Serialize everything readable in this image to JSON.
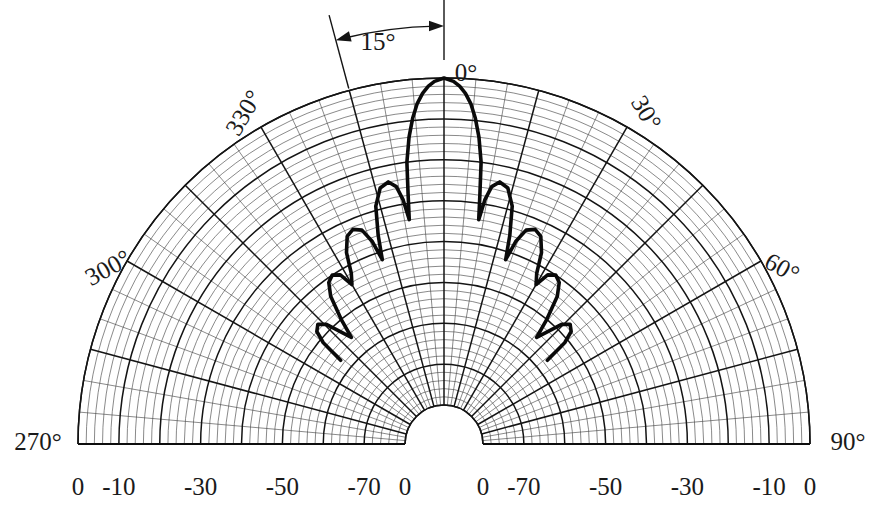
{
  "chart_data": {
    "type": "line",
    "plot_style": "polar-half",
    "title": "",
    "xlabel": "",
    "ylabel": "",
    "angular_axis": {
      "label": "Angle (degrees)",
      "unit": "degrees",
      "range": [
        270,
        450
      ],
      "center_angle": 0,
      "tick_interval_minor": 5,
      "tick_interval_major": 15,
      "tick_labels": [
        {
          "value": 270,
          "text": "270°"
        },
        {
          "value": 300,
          "text": "300°"
        },
        {
          "value": 330,
          "text": "330°"
        },
        {
          "value": 0,
          "text": "0°"
        },
        {
          "value": 30,
          "text": "30°"
        },
        {
          "value": 60,
          "text": "60°"
        },
        {
          "value": 90,
          "text": "90°"
        }
      ]
    },
    "radial_axis": {
      "label": "Relative power (dB)",
      "unit": "dB",
      "outer_value": 0,
      "inner_value": -80,
      "ring_interval_minor": 2,
      "ring_interval_major": 10,
      "left_tick_labels": [
        "0",
        "-10",
        "-30",
        "-50",
        "-70",
        "0"
      ],
      "left_tick_db": [
        0,
        -10,
        -30,
        -50,
        -70,
        -80
      ],
      "right_tick_labels": [
        "0",
        "-70",
        "-50",
        "-30",
        "-10",
        "0"
      ],
      "right_tick_db": [
        -80,
        -70,
        -50,
        -30,
        -10,
        0
      ]
    },
    "grid": true,
    "legend": null,
    "annotations": [
      {
        "text": "15°",
        "type": "double-arrow-arc",
        "from_angle": -15,
        "to_angle": 0,
        "note": "beam offset indicator between the 345° spoke and the 0° axis"
      },
      {
        "text": "0°",
        "type": "axis-marker",
        "angle": 0
      }
    ],
    "series": [
      {
        "name": "Measured radiation pattern",
        "angle_unit": "degrees",
        "value_unit": "dB",
        "points": [
          {
            "angle": -51.0,
            "db": -57.0
          },
          {
            "angle": -50.0,
            "db": -51.0
          },
          {
            "angle": -48.5,
            "db": -48.0
          },
          {
            "angle": -46.5,
            "db": -47.0
          },
          {
            "angle": -44.5,
            "db": -48.5
          },
          {
            "angle": -42.5,
            "db": -52.5
          },
          {
            "angle": -41.0,
            "db": -55.0
          },
          {
            "angle": -39.5,
            "db": -50.0
          },
          {
            "angle": -37.5,
            "db": -44.0
          },
          {
            "angle": -35.5,
            "db": -41.0
          },
          {
            "angle": -33.5,
            "db": -40.0
          },
          {
            "angle": -31.5,
            "db": -41.0
          },
          {
            "angle": -30.0,
            "db": -44.5
          },
          {
            "angle": -28.5,
            "db": -42.0
          },
          {
            "angle": -27.0,
            "db": -37.0
          },
          {
            "angle": -25.0,
            "db": -33.5
          },
          {
            "angle": -23.0,
            "db": -32.5
          },
          {
            "angle": -21.0,
            "db": -33.5
          },
          {
            "angle": -19.5,
            "db": -37.0
          },
          {
            "angle": -18.5,
            "db": -42.0
          },
          {
            "angle": -17.5,
            "db": -36.0
          },
          {
            "angle": -16.0,
            "db": -29.0
          },
          {
            "angle": -14.0,
            "db": -25.0
          },
          {
            "angle": -12.0,
            "db": -24.0
          },
          {
            "angle": -10.5,
            "db": -25.5
          },
          {
            "angle": -9.5,
            "db": -29.0
          },
          {
            "angle": -8.8,
            "db": -34.0
          },
          {
            "angle": -8.2,
            "db": -28.0
          },
          {
            "angle": -7.5,
            "db": -20.0
          },
          {
            "angle": -6.5,
            "db": -14.0
          },
          {
            "angle": -5.5,
            "db": -9.5
          },
          {
            "angle": -4.5,
            "db": -6.0
          },
          {
            "angle": -3.5,
            "db": -3.6
          },
          {
            "angle": -2.5,
            "db": -1.9
          },
          {
            "angle": -1.5,
            "db": -0.8
          },
          {
            "angle": 0.0,
            "db": 0.0
          },
          {
            "angle": 1.5,
            "db": -0.8
          },
          {
            "angle": 2.5,
            "db": -1.9
          },
          {
            "angle": 3.5,
            "db": -3.6
          },
          {
            "angle": 4.5,
            "db": -6.0
          },
          {
            "angle": 5.5,
            "db": -9.5
          },
          {
            "angle": 6.5,
            "db": -14.0
          },
          {
            "angle": 7.5,
            "db": -20.0
          },
          {
            "angle": 8.2,
            "db": -28.0
          },
          {
            "angle": 8.8,
            "db": -34.0
          },
          {
            "angle": 9.5,
            "db": -29.0
          },
          {
            "angle": 10.5,
            "db": -25.5
          },
          {
            "angle": 12.0,
            "db": -24.0
          },
          {
            "angle": 14.0,
            "db": -25.0
          },
          {
            "angle": 16.0,
            "db": -29.0
          },
          {
            "angle": 17.5,
            "db": -36.0
          },
          {
            "angle": 18.5,
            "db": -42.0
          },
          {
            "angle": 19.5,
            "db": -37.0
          },
          {
            "angle": 21.0,
            "db": -33.5
          },
          {
            "angle": 23.0,
            "db": -32.5
          },
          {
            "angle": 25.0,
            "db": -33.5
          },
          {
            "angle": 27.0,
            "db": -37.0
          },
          {
            "angle": 28.5,
            "db": -42.0
          },
          {
            "angle": 30.0,
            "db": -44.5
          },
          {
            "angle": 31.5,
            "db": -41.0
          },
          {
            "angle": 33.5,
            "db": -40.0
          },
          {
            "angle": 35.5,
            "db": -41.0
          },
          {
            "angle": 37.5,
            "db": -44.0
          },
          {
            "angle": 39.5,
            "db": -50.0
          },
          {
            "angle": 41.0,
            "db": -55.0
          },
          {
            "angle": 42.5,
            "db": -52.5
          },
          {
            "angle": 44.5,
            "db": -48.5
          },
          {
            "angle": 46.5,
            "db": -47.0
          },
          {
            "angle": 48.5,
            "db": -48.0
          },
          {
            "angle": 50.0,
            "db": -51.0
          },
          {
            "angle": 51.0,
            "db": -57.0
          }
        ]
      }
    ]
  },
  "colors": {
    "background": "#ffffff",
    "trace": "#0a0a0a",
    "grid_major": "#141414",
    "grid_minor": "#4a4a4a",
    "text": "#1a1a1a"
  }
}
